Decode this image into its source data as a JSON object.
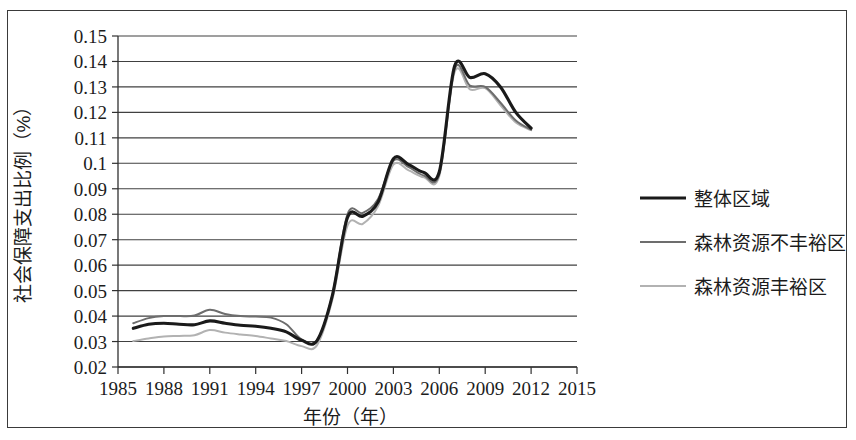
{
  "chart_data": {
    "type": "line",
    "title": "",
    "xlabel": "年份（年）",
    "ylabel": "社会保障支出比例（%）",
    "xlim": [
      1985,
      2015
    ],
    "ylim": [
      0.02,
      0.15
    ],
    "grid": true,
    "legend_position": "right",
    "xticks": [
      "1985",
      "1988",
      "1991",
      "1994",
      "1997",
      "2000",
      "2003",
      "2006",
      "2009",
      "2012",
      "2015"
    ],
    "yticks": [
      "0.15",
      "0.14",
      "0.13",
      "0.12",
      "0.11",
      "0.1",
      "0.09",
      "0.08",
      "0.07",
      "0.06",
      "0.05",
      "0.04",
      "0.03",
      "0.02"
    ],
    "x": [
      1986,
      1987,
      1988,
      1989,
      1990,
      1991,
      1992,
      1993,
      1994,
      1995,
      1996,
      1997,
      1998,
      1999,
      2000,
      2001,
      2002,
      2003,
      2004,
      2005,
      2006,
      2007,
      2008,
      2009,
      2010,
      2011,
      2012
    ],
    "series": [
      {
        "name": "整体区域",
        "color": "#1a1a1a",
        "width": 3.1,
        "values": [
          0.0352,
          0.0368,
          0.0372,
          0.0368,
          0.0366,
          0.0381,
          0.0372,
          0.0364,
          0.036,
          0.0352,
          0.0338,
          0.0305,
          0.0303,
          0.0478,
          0.0787,
          0.0792,
          0.0848,
          0.1018,
          0.0995,
          0.0964,
          0.0967,
          0.1382,
          0.1337,
          0.1352,
          0.13,
          0.12,
          0.1138
        ]
      },
      {
        "name": "森林资源不丰裕区",
        "color": "#6d6d6d",
        "width": 2.0,
        "values": [
          0.0372,
          0.0392,
          0.04,
          0.04,
          0.0402,
          0.0425,
          0.0408,
          0.04,
          0.0398,
          0.0394,
          0.0368,
          0.0308,
          0.0304,
          0.048,
          0.08,
          0.0805,
          0.086,
          0.101,
          0.0985,
          0.0952,
          0.0958,
          0.137,
          0.1305,
          0.13,
          0.1238,
          0.1168,
          0.1132
        ]
      },
      {
        "name": "森林资源丰裕区",
        "color": "#b2b2b2",
        "width": 2.0,
        "values": [
          0.0302,
          0.0312,
          0.032,
          0.0322,
          0.0325,
          0.0345,
          0.0335,
          0.0328,
          0.0322,
          0.0312,
          0.0302,
          0.0282,
          0.0285,
          0.0462,
          0.0755,
          0.0762,
          0.0832,
          0.0995,
          0.0972,
          0.0945,
          0.095,
          0.1358,
          0.129,
          0.1295,
          0.1228,
          0.116,
          0.113
        ]
      }
    ]
  },
  "legend": {
    "items": [
      {
        "label": "整体区域"
      },
      {
        "label": "森林资源不丰裕区"
      },
      {
        "label": "森林资源丰裕区"
      }
    ]
  }
}
